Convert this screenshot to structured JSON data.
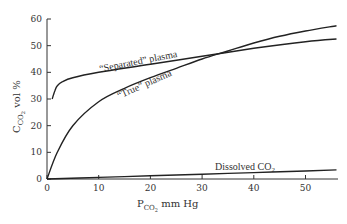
{
  "chart_data": {
    "type": "line",
    "title": "",
    "xlabel": "P_CO2 mm Hg",
    "xlabel_main": "P",
    "xlabel_sub": "CO",
    "xlabel_subsub": "2",
    "xlabel_rest": " mm Hg",
    "ylabel": "C_CO2 vol %",
    "ylabel_main": "C",
    "ylabel_sub": "CO",
    "ylabel_subsub": "2",
    "ylabel_rest": " vol %",
    "xlim": [
      0,
      56
    ],
    "ylim": [
      0,
      60
    ],
    "x_ticks": [
      0,
      10,
      20,
      30,
      40,
      50
    ],
    "y_ticks": [
      0,
      10,
      20,
      30,
      40,
      50,
      60
    ],
    "grid": false,
    "legend": "inline labels on curves",
    "series": [
      {
        "name": "\"Separated\" plasma",
        "label": "“Separated” plasma",
        "x": [
          1,
          1.5,
          2,
          3,
          5,
          10,
          20,
          30,
          40,
          50,
          56
        ],
        "y": [
          30,
          33,
          35,
          36.5,
          38,
          40,
          43,
          46,
          49,
          51.5,
          52.5
        ]
      },
      {
        "name": "\"True\" plasma",
        "label": "“True” plasma",
        "x": [
          0,
          2,
          5,
          10,
          15,
          20,
          25,
          30,
          35,
          40,
          45,
          50,
          56
        ],
        "y": [
          0,
          10,
          20,
          29,
          34,
          38,
          41.5,
          45,
          48,
          51,
          53.5,
          55.5,
          57.5
        ]
      },
      {
        "name": "Dissolved CO2",
        "label_main": "Dissolved CO",
        "label_sub": "2",
        "x": [
          0,
          10,
          20,
          30,
          40,
          50,
          56
        ],
        "y": [
          0,
          0.6,
          1.2,
          1.8,
          2.4,
          3.0,
          3.4
        ]
      }
    ]
  }
}
